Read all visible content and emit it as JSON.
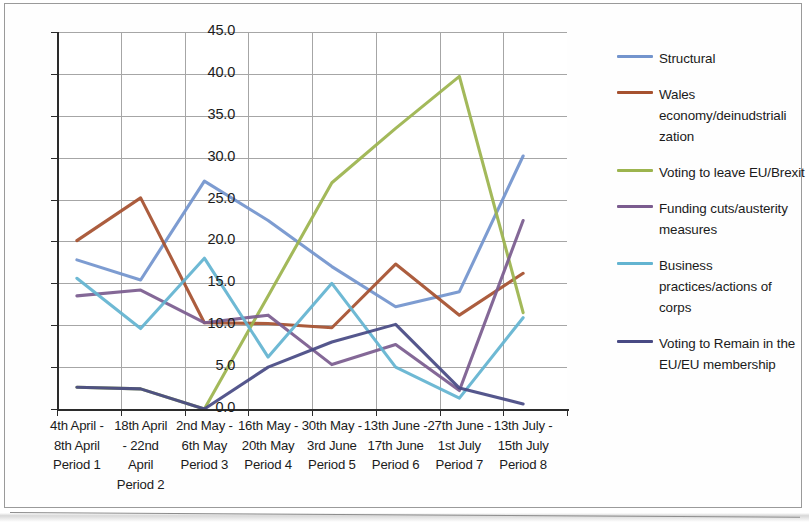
{
  "chart_data": {
    "type": "line",
    "title": "",
    "xlabel": "",
    "ylabel": "",
    "ylim": [
      0.0,
      45.0
    ],
    "ytick_labels": [
      "45.0",
      "40.0",
      "35.0",
      "30.0",
      "25.0",
      "20.0",
      "15.0",
      "10.0",
      "5.0",
      "0.0"
    ],
    "ytick_values": [
      45.0,
      40.0,
      35.0,
      30.0,
      25.0,
      20.0,
      15.0,
      10.0,
      5.0,
      0.0
    ],
    "grid": true,
    "legend_position": "right",
    "categories": [
      "4th April - 8th April Period 1",
      "18th April - 22nd April Period 2",
      "2nd May - 6th May Period 3",
      "16th May -20th May Period 4",
      "30th May -3rd June Period 5",
      "13th June -17th June Period 6",
      "27th June - 1st July Period 7",
      "13th July - 15th July Period 8"
    ],
    "category_lines": [
      [
        "4th April -",
        "8th April",
        "Period 1"
      ],
      [
        "18th April",
        "- 22nd",
        "April",
        "Period 2"
      ],
      [
        "2nd May -",
        "6th May",
        "Period 3"
      ],
      [
        "16th May -",
        "20th May",
        "Period 4"
      ],
      [
        "30th May -",
        "3rd June",
        "Period 5"
      ],
      [
        "13th June -",
        "17th June",
        "Period 6"
      ],
      [
        "27th June -",
        "1st July",
        "Period 7"
      ],
      [
        "13th July -",
        "15th July",
        "Period 8"
      ]
    ],
    "series": [
      {
        "name": "Structural",
        "color": "#7394cd",
        "values": [
          17.8,
          15.4,
          27.2,
          22.5,
          17.0,
          12.2,
          14.0,
          30.2
        ]
      },
      {
        "name": "Wales economy/deinudstrialization",
        "color": "#a6512f",
        "values": [
          20.1,
          25.2,
          10.3,
          10.2,
          9.7,
          17.3,
          11.2,
          16.2
        ]
      },
      {
        "name": "Voting to leave EU/Brexit",
        "color": "#9cb44e",
        "values": [
          2.6,
          2.4,
          0.0,
          13.5,
          27.0,
          33.5,
          39.7,
          11.5
        ]
      },
      {
        "name": "Funding cuts/austerity measures",
        "color": "#7b5c8f",
        "values": [
          13.5,
          14.2,
          10.3,
          11.2,
          5.3,
          7.7,
          2.2,
          22.5
        ]
      },
      {
        "name": "Business practices/actions of corps",
        "color": "#63b4d1",
        "values": [
          15.6,
          9.6,
          18.0,
          6.2,
          15.0,
          5.0,
          1.3,
          10.9
        ]
      },
      {
        "name": "Voting to Remain in the EU/EU membership",
        "color": "#484a84",
        "values": [
          2.6,
          2.4,
          0.0,
          5.0,
          8.0,
          10.1,
          2.5,
          0.6
        ]
      }
    ]
  },
  "legend": {
    "items": [
      {
        "label": "Structural",
        "color": "#7394cd"
      },
      {
        "label": "Wales economy/deinudstriali zation",
        "color": "#a6512f"
      },
      {
        "label": "Voting to leave EU/Brexit",
        "color": "#9cb44e"
      },
      {
        "label": "Funding cuts/austerity measures",
        "color": "#7b5c8f"
      },
      {
        "label": "Business practices/actions of corps",
        "color": "#63b4d1"
      },
      {
        "label": "Voting to Remain in the EU/EU membership",
        "color": "#484a84"
      }
    ]
  }
}
